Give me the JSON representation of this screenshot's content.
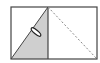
{
  "diagram": {
    "colors": {
      "stroke": "#444444",
      "shade": "#cfcfcf",
      "dashed": "#888888",
      "background": "#ffffff"
    },
    "left_square": {
      "shaded_triangle": true,
      "diagonal": "solid",
      "marker": "ellipse"
    },
    "right_square": {
      "diagonal": "dashed"
    }
  }
}
